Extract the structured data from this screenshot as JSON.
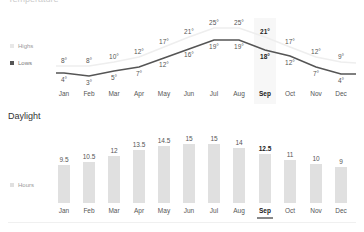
{
  "temperature": {
    "title": "Temperature",
    "legend": [
      {
        "label": "Highs",
        "color": "#e8e8e8"
      },
      {
        "label": "Lows",
        "color": "#555555"
      }
    ]
  },
  "daylight": {
    "title": "Daylight",
    "legend": [
      {
        "label": "Hours",
        "color": "#e0e0e0"
      }
    ]
  },
  "selected_month": "Sep",
  "months": [
    "Jan",
    "Feb",
    "Mar",
    "Apr",
    "May",
    "Jun",
    "Jul",
    "Aug",
    "Sep",
    "Oct",
    "Nov",
    "Dec"
  ],
  "highs_labels": [
    "8°",
    "8°",
    "10°",
    "12°",
    "17°",
    "21°",
    "25°",
    "25°",
    "21°",
    "17°",
    "12°",
    "9°"
  ],
  "lows_labels": [
    "4°",
    "3°",
    "5°",
    "7°",
    "12°",
    "16°",
    "19°",
    "19°",
    "18°",
    "12°",
    "7°",
    "4°"
  ],
  "hours_labels": [
    "9.5",
    "10.5",
    "12",
    "13.5",
    "14.5",
    "15",
    "15",
    "14",
    "12.5",
    "11",
    "10",
    "9"
  ],
  "chart_data": [
    {
      "type": "line",
      "title": "Temperature",
      "categories": [
        "Jan",
        "Feb",
        "Mar",
        "Apr",
        "May",
        "Jun",
        "Jul",
        "Aug",
        "Sep",
        "Oct",
        "Nov",
        "Dec"
      ],
      "series": [
        {
          "name": "Highs",
          "values": [
            8,
            8,
            10,
            12,
            17,
            21,
            25,
            25,
            21,
            17,
            12,
            9
          ],
          "unit": "°"
        },
        {
          "name": "Lows",
          "values": [
            4,
            3,
            5,
            7,
            12,
            16,
            19,
            19,
            18,
            12,
            7,
            4
          ],
          "unit": "°"
        }
      ],
      "highlighted": "Sep",
      "legend_position": "left",
      "grid": false
    },
    {
      "type": "bar",
      "title": "Daylight",
      "categories": [
        "Jan",
        "Feb",
        "Mar",
        "Apr",
        "May",
        "Jun",
        "Jul",
        "Aug",
        "Sep",
        "Oct",
        "Nov",
        "Dec"
      ],
      "series": [
        {
          "name": "Hours",
          "values": [
            9.5,
            10.5,
            12,
            13.5,
            14.5,
            15,
            15,
            14,
            12.5,
            11,
            10,
            9
          ]
        }
      ],
      "highlighted": "Sep",
      "legend_position": "left",
      "grid": false
    }
  ]
}
